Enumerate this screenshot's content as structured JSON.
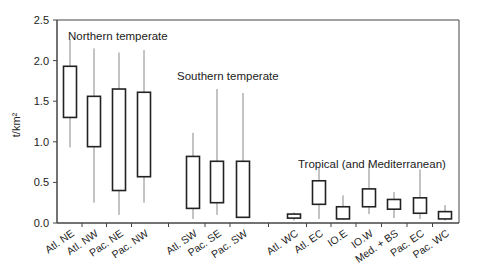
{
  "chart_data": {
    "type": "box",
    "title": "",
    "xlabel": "",
    "ylabel": "t/km²",
    "ylim": [
      0,
      2.5
    ],
    "yticks": [
      "0.0",
      "0.5",
      "1.0",
      "1.5",
      "2.0",
      "2.5"
    ],
    "grid": false,
    "groups": [
      {
        "label": "Northern temperate",
        "categories": [
          "Atl. NE",
          "Atl. NW",
          "Pac. NE",
          "Pac. NW"
        ]
      },
      {
        "label": "Southern temperate",
        "categories": [
          "Atl. SW",
          "Pac. SE",
          "Pac. SW"
        ]
      },
      {
        "label": "Tropical (and Mediterranean)",
        "categories": [
          "Atl. WC",
          "Atl. EC",
          "IO.E",
          "IO.W",
          "Med. + BS",
          "Pac. EC",
          "Pac. WC"
        ]
      }
    ],
    "categories": [
      "Atl. NE",
      "Atl. NW",
      "Pac. NE",
      "Pac. NW",
      "Atl. SW",
      "Pac. SE",
      "Pac. SW",
      "Atl. WC",
      "Atl. EC",
      "IO.E",
      "IO.W",
      "Med. + BS",
      "Pac. EC",
      "Pac. WC"
    ],
    "boxes": [
      {
        "label": "Atl. NE",
        "whisker_low": 0.93,
        "q1": 1.3,
        "q3": 1.93,
        "whisker_high": 2.26
      },
      {
        "label": "Atl. NW",
        "whisker_low": 0.25,
        "q1": 0.94,
        "q3": 1.56,
        "whisker_high": 2.15
      },
      {
        "label": "Pac. NE",
        "whisker_low": 0.1,
        "q1": 0.4,
        "q3": 1.65,
        "whisker_high": 2.1
      },
      {
        "label": "Pac. NW",
        "whisker_low": 0.25,
        "q1": 0.57,
        "q3": 1.61,
        "whisker_high": 2.13
      },
      {
        "label": "Atl. SW",
        "whisker_low": 0.05,
        "q1": 0.18,
        "q3": 0.82,
        "whisker_high": 1.11
      },
      {
        "label": "Pac. SE",
        "whisker_low": 0.1,
        "q1": 0.25,
        "q3": 0.76,
        "whisker_high": 1.65
      },
      {
        "label": "Pac. SW",
        "whisker_low": 0.07,
        "q1": 0.07,
        "q3": 0.76,
        "whisker_high": 1.6
      },
      {
        "label": "Atl. WC",
        "whisker_low": 0.03,
        "q1": 0.06,
        "q3": 0.11,
        "whisker_high": 0.13
      },
      {
        "label": "Atl. EC",
        "whisker_low": 0.05,
        "q1": 0.23,
        "q3": 0.52,
        "whisker_high": 0.69
      },
      {
        "label": "IO.E",
        "whisker_low": 0.04,
        "q1": 0.05,
        "q3": 0.2,
        "whisker_high": 0.34
      },
      {
        "label": "IO.W",
        "whisker_low": 0.11,
        "q1": 0.2,
        "q3": 0.42,
        "whisker_high": 0.74
      },
      {
        "label": "Med. + BS",
        "whisker_low": 0.06,
        "q1": 0.17,
        "q3": 0.29,
        "whisker_high": 0.38
      },
      {
        "label": "Pac. EC",
        "whisker_low": 0.05,
        "q1": 0.12,
        "q3": 0.31,
        "whisker_high": 0.66
      },
      {
        "label": "Pac. WC",
        "whisker_low": 0.03,
        "q1": 0.05,
        "q3": 0.14,
        "whisker_high": 0.22
      }
    ],
    "layout": {
      "plot_left": 57,
      "plot_right": 459,
      "plot_top": 20,
      "plot_bottom": 223,
      "box_x": [
        70,
        94,
        119,
        144,
        193,
        217,
        243,
        294,
        319,
        343,
        369,
        394,
        420,
        445
      ],
      "box_width": 13,
      "group_label_positions": [
        [
          68,
          40
        ],
        [
          177,
          80
        ],
        [
          298,
          168
        ]
      ],
      "colors": {
        "axis": "#444444",
        "box_stroke": "#222222",
        "whisker": "#888888",
        "text": "#222222",
        "background": "#ffffff"
      }
    }
  }
}
